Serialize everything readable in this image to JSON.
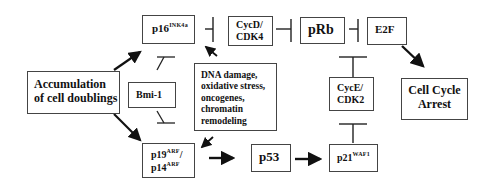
{
  "diagram": {
    "nodes": {
      "p16": {
        "main": "p16",
        "sup": "INK4a"
      },
      "cycd": {
        "line1": "CycD/",
        "line2": "CDK4"
      },
      "prb": {
        "label": "pRb"
      },
      "e2f": {
        "label": "E2F"
      },
      "accum": {
        "line1": "Accumulation",
        "line2": "of cell doublings"
      },
      "bmi1": {
        "label": "Bmi-1"
      },
      "dna": {
        "line1": "DNA damage,",
        "line2": "oxidative stress,",
        "line3": "oncogenes,",
        "line4": "chromatin",
        "line5": "remodeling"
      },
      "cyce": {
        "line1": "CycE/",
        "line2": "CDK2"
      },
      "arrest": {
        "line1": "Cell Cycle",
        "line2": "Arrest"
      },
      "p19": {
        "main1": "p19",
        "sup1": "ARF",
        "slash": "/",
        "main2": "p14",
        "sup2": "ARF"
      },
      "p53": {
        "label": "p53"
      },
      "p21": {
        "main": "p21",
        "sup": "WAF1"
      }
    },
    "edges": [
      {
        "from": "accum",
        "to": "p16",
        "type": "activation"
      },
      {
        "from": "accum",
        "to": "p19",
        "type": "activation"
      },
      {
        "from": "bmi1",
        "to": "p16",
        "type": "inhibition"
      },
      {
        "from": "bmi1",
        "to": "p19",
        "type": "inhibition"
      },
      {
        "from": "dna",
        "to": "p16",
        "type": "activation"
      },
      {
        "from": "dna",
        "to": "p19",
        "type": "activation"
      },
      {
        "from": "p16",
        "to": "cycd",
        "type": "inhibition"
      },
      {
        "from": "cycd",
        "to": "prb",
        "type": "inhibition"
      },
      {
        "from": "prb",
        "to": "e2f",
        "type": "inhibition"
      },
      {
        "from": "cyce",
        "to": "prb",
        "type": "inhibition"
      },
      {
        "from": "e2f",
        "to": "arrest",
        "type": "activation"
      },
      {
        "from": "p19",
        "to": "p53",
        "type": "activation"
      },
      {
        "from": "p53",
        "to": "p21",
        "type": "activation"
      },
      {
        "from": "p21",
        "to": "cyce",
        "type": "inhibition"
      }
    ]
  }
}
